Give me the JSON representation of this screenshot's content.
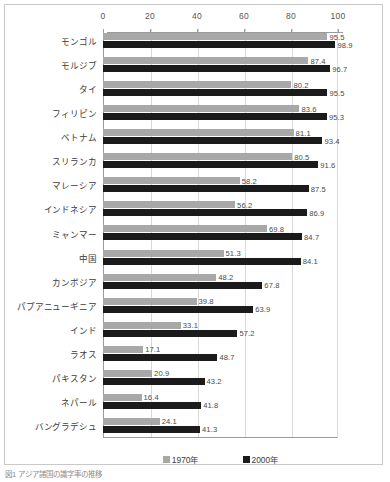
{
  "chart_data": {
    "type": "bar",
    "orientation": "horizontal",
    "title": "",
    "subtitle": "",
    "xlabel": "",
    "ylabel": "",
    "xlim": [
      0,
      100
    ],
    "xticks": [
      0,
      20,
      40,
      60,
      80,
      100
    ],
    "grid": true,
    "axis_position": "top",
    "legend_position": "bottom-center",
    "categories": [
      "モンゴル",
      "モルジブ",
      "タイ",
      "フィリピン",
      "ベトナム",
      "スリランカ",
      "マレーシア",
      "インドネシア",
      "ミャンマー",
      "中国",
      "カンボジア",
      "パプアニューギニア",
      "インド",
      "ラオス",
      "パキスタン",
      "ネパール",
      "バングラデシュ"
    ],
    "series": [
      {
        "name": "1970年",
        "color": "#a8a8a8",
        "values": [
          95.5,
          87.4,
          80.2,
          83.6,
          81.1,
          80.5,
          58.2,
          56.2,
          69.8,
          51.3,
          48.2,
          39.8,
          33.1,
          17.1,
          20.9,
          16.4,
          24.1
        ]
      },
      {
        "name": "2000年",
        "color": "#1b1b1b",
        "values": [
          98.9,
          96.7,
          95.5,
          95.3,
          93.4,
          91.6,
          87.5,
          86.9,
          84.7,
          84.1,
          67.8,
          63.9,
          57.2,
          48.7,
          43.2,
          41.8,
          41.3
        ]
      }
    ]
  },
  "legend": {
    "items": [
      {
        "label": "1970年",
        "color": "#a8a8a8"
      },
      {
        "label": "2000年",
        "color": "#1b1b1b"
      }
    ]
  },
  "caption": {
    "text": "図1 アジア諸国の識字率の推移"
  },
  "colors": {
    "series_1970": "#a8a8a8",
    "series_2000": "#1b1b1b",
    "frame": "#c9c9c9",
    "axis": "#9a9a9a",
    "grid": "#d8d8d8"
  }
}
